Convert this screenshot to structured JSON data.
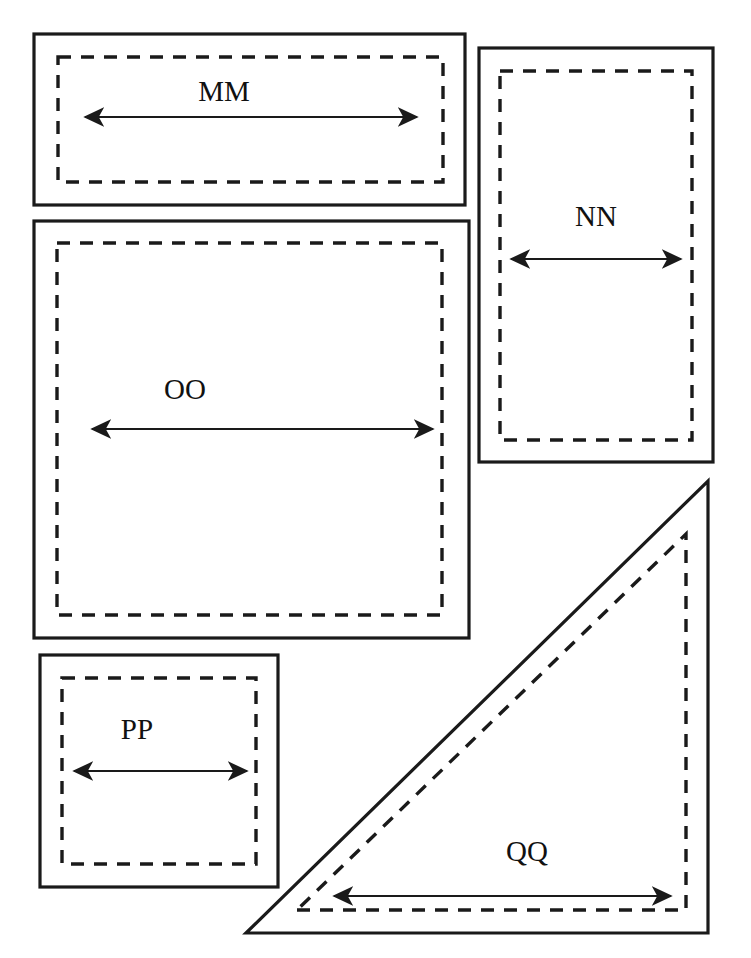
{
  "figure": {
    "background_color": "#ffffff",
    "line_color": "#1a1a1a",
    "width": 751,
    "height": 958
  },
  "shapes": [
    {
      "id": "MM",
      "label": "MM",
      "type": "rectangle",
      "outer": {
        "x": 34,
        "y": 34,
        "width": 431,
        "height": 171
      },
      "inner_dashed": {
        "x": 58,
        "y": 57,
        "width": 385,
        "height": 125
      },
      "dimension": {
        "orientation": "horizontal",
        "x1": 85,
        "x2": 417,
        "y": 117,
        "label_x": 224,
        "label_y": 101
      }
    },
    {
      "id": "NN",
      "label": "NN",
      "type": "rectangle",
      "outer": {
        "x": 479,
        "y": 48,
        "width": 234,
        "height": 414
      },
      "inner_dashed": {
        "x": 500,
        "y": 71,
        "width": 192,
        "height": 369
      },
      "dimension": {
        "orientation": "horizontal",
        "x1": 511,
        "x2": 681,
        "y": 259,
        "label_x": 596,
        "label_y": 226
      }
    },
    {
      "id": "OO",
      "label": "OO",
      "type": "rectangle",
      "outer": {
        "x": 34,
        "y": 221,
        "width": 435,
        "height": 417
      },
      "inner_dashed": {
        "x": 57,
        "y": 243,
        "width": 385,
        "height": 372
      },
      "dimension": {
        "orientation": "horizontal",
        "x1": 92,
        "x2": 433,
        "y": 429,
        "label_x": 185,
        "label_y": 399
      }
    },
    {
      "id": "PP",
      "label": "PP",
      "type": "rectangle",
      "outer": {
        "x": 40,
        "y": 655,
        "width": 238,
        "height": 232
      },
      "inner_dashed": {
        "x": 62,
        "y": 678,
        "width": 194,
        "height": 186
      },
      "dimension": {
        "orientation": "horizontal",
        "x1": 74,
        "x2": 247,
        "y": 771,
        "label_x": 137,
        "label_y": 739
      }
    },
    {
      "id": "QQ",
      "label": "QQ",
      "type": "right-triangle",
      "outer_points": "246,933 708,933 708,481",
      "inner_dashed_points": "297,910 686,910 686,534",
      "dimension": {
        "orientation": "horizontal",
        "x1": 334,
        "x2": 671,
        "y": 896,
        "label_x": 527,
        "label_y": 861
      }
    }
  ]
}
